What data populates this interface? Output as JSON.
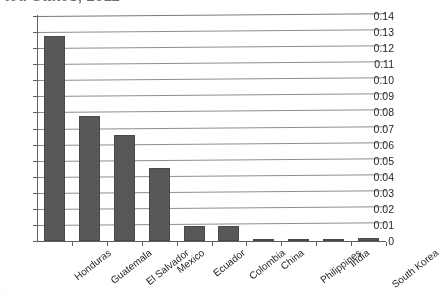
{
  "chart_data": {
    "type": "bar",
    "title": "ted States, 2011",
    "title_note": "title row is clipped at the top edge of the screenshot",
    "xlabel": "",
    "ylabel": "",
    "categories": [
      "Honduras",
      "Guatemala",
      "El Salvador",
      "Mexico",
      "Ecuador",
      "Colombia",
      "China",
      "Philippines",
      "India",
      "South Korea"
    ],
    "values": [
      0.1275,
      0.0775,
      0.066,
      0.0455,
      0.0095,
      0.0095,
      0.0015,
      0.001,
      0.0013,
      0.0018
    ],
    "ylim": [
      0,
      0.14
    ],
    "ytick_values": [
      0,
      0.01,
      0.02,
      0.03,
      0.04,
      0.05,
      0.06,
      0.07,
      0.08,
      0.09,
      0.1,
      0.11,
      0.12,
      0.13,
      0.14
    ],
    "ytick_labels": [
      "0",
      "0.01",
      "0.02",
      "0.03",
      "0.04",
      "0.05",
      "0.06",
      "0.07",
      "0.08",
      "0.09",
      "0.10",
      "0.11",
      "0.12",
      "0.13",
      "0.14"
    ],
    "grid": true,
    "grid_axis": "y",
    "legend": false,
    "legend_position": "none",
    "series_color": "#585858",
    "gridline_color": "#8e8e8e",
    "axis_color": "#5e5e5e",
    "background_color": "#ffffff"
  }
}
